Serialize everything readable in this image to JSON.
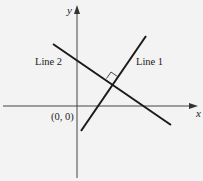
{
  "diagram": {
    "type": "coordinate-plane",
    "axes": {
      "x_label": "x",
      "y_label": "y",
      "origin_label": "(0, 0)"
    },
    "lines": [
      {
        "id": "line1",
        "label": "Line 1",
        "slope": "positive"
      },
      {
        "id": "line2",
        "label": "Line 2",
        "slope": "negative"
      }
    ],
    "annotations": {
      "right_angle": "Line 1 is perpendicular to Line 2 at their intersection"
    },
    "colors": {
      "background": "#f3f3f3",
      "stroke": "#1a1a1a"
    }
  }
}
